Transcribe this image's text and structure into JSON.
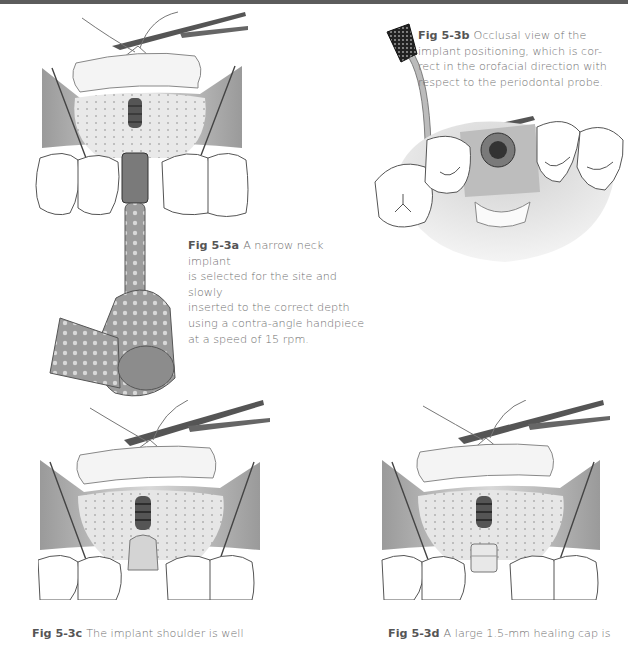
{
  "page": {
    "header_bar_color": "#5c5c5c"
  },
  "figures": [
    {
      "id": "5-3a",
      "label": "Fig 5-3a",
      "caption": "A narrow neck implant is selected for the site and slowly inserted to the correct depth using a contra-angle handpiece at a speed of 15 rpm.",
      "caption_lines": [
        "A narrow neck implant",
        "is selected for the site and slowly",
        "inserted to the correct depth",
        "using a contra-angle handpiece",
        "at a speed of 15 rpm."
      ],
      "illustration": "implant-insertion-with-contra-angle-handpiece"
    },
    {
      "id": "5-3b",
      "label": "Fig 5-3b",
      "caption": "Occlusal view of the implant positioning, which is correct in the orofacial direction with respect to the periodontal probe.",
      "caption_lines": [
        "Occlusal view of the",
        "implant positioning, which is cor-",
        "rect in the orofacial direction with",
        "respect to the periodontal probe."
      ],
      "illustration": "occlusal-view-with-periodontal-probe"
    },
    {
      "id": "5-3c",
      "label": "Fig 5-3c",
      "caption": "The implant shoulder is well",
      "illustration": "implant-shoulder-in-site"
    },
    {
      "id": "5-3d",
      "label": "Fig 5-3d",
      "caption": "A large 1.5-mm healing cap is",
      "illustration": "healing-cap-placed"
    }
  ]
}
